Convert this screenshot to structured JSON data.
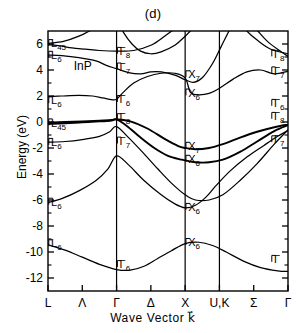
{
  "chart_data": {
    "type": "line",
    "title": "(d)",
    "material": "InP",
    "xlabel": "Wave  Vector  k⃗",
    "ylabel": "Energy  (eV)",
    "ylim": [
      -13,
      7
    ],
    "yticks": [
      6,
      4,
      2,
      0,
      -2,
      -4,
      -6,
      -8,
      -10,
      -12
    ],
    "ytick_labels": [
      "6",
      "4",
      "2",
      "0",
      "-2",
      "-4",
      "-6",
      "-8",
      "-10",
      "-12"
    ],
    "xticks": [
      0,
      1,
      2,
      3,
      4,
      5,
      6,
      7
    ],
    "xtick_labels": [
      "L",
      "Λ",
      "Γ",
      "Δ",
      "X",
      "U,K",
      "Σ",
      "Γ"
    ],
    "vertical_dividers": [
      "Γ",
      "X",
      "U,K"
    ],
    "grid": false,
    "legend": false,
    "point_labels": [
      {
        "text": "L",
        "sub": "45",
        "energy": 6.0,
        "kpoint": "L"
      },
      {
        "text": "L",
        "sub": "6",
        "energy": 5.1,
        "kpoint": "L"
      },
      {
        "text": "L",
        "sub": "6",
        "energy": 1.6,
        "kpoint": "L"
      },
      {
        "text": "L",
        "sub": "45",
        "energy": -0.1,
        "kpoint": "L"
      },
      {
        "text": "L",
        "sub": "6",
        "energy": -1.6,
        "kpoint": "L"
      },
      {
        "text": "L",
        "sub": "6",
        "energy": -6.2,
        "kpoint": "L"
      },
      {
        "text": "L",
        "sub": "6",
        "energy": -9.4,
        "kpoint": "L"
      },
      {
        "text": "Γ",
        "sub": "8",
        "energy": 5.4,
        "kpoint": "Γ"
      },
      {
        "text": "Γ",
        "sub": "7",
        "energy": 4.2,
        "kpoint": "Γ"
      },
      {
        "text": "Γ",
        "sub": "6",
        "energy": 1.7,
        "kpoint": "Γ"
      },
      {
        "text": "Γ",
        "sub": "8",
        "energy": 0.3,
        "kpoint": "Γ"
      },
      {
        "text": "Γ",
        "sub": "7",
        "energy": -1.5,
        "kpoint": "Γ"
      },
      {
        "text": "Γ",
        "sub": "6",
        "energy": -11.0,
        "kpoint": "Γ"
      },
      {
        "text": "X",
        "sub": "7",
        "energy": 3.6,
        "kpoint": "X"
      },
      {
        "text": "X",
        "sub": "6",
        "energy": 2.2,
        "kpoint": "X"
      },
      {
        "text": "X",
        "sub": "7",
        "energy": -1.9,
        "kpoint": "X"
      },
      {
        "text": "X",
        "sub": "6",
        "energy": -2.9,
        "kpoint": "X"
      },
      {
        "text": "X",
        "sub": "6",
        "energy": -6.6,
        "kpoint": "X"
      },
      {
        "text": "X",
        "sub": "6",
        "energy": -9.3,
        "kpoint": "X"
      },
      {
        "text": "Γ",
        "sub": "8",
        "energy": 5.2,
        "kpoint": "Γ-right"
      },
      {
        "text": "Γ",
        "sub": "7",
        "energy": 3.9,
        "kpoint": "Γ-right"
      },
      {
        "text": "Γ",
        "sub": "6",
        "energy": 1.4,
        "kpoint": "Γ-right"
      },
      {
        "text": "Γ",
        "sub": "8",
        "energy": 0.4,
        "kpoint": "Γ-right"
      },
      {
        "text": "Γ",
        "sub": "7",
        "energy": -1.4,
        "kpoint": "Γ-right"
      },
      {
        "text": "Γ",
        "sub": "",
        "energy": -10.6,
        "kpoint": "Γ-right"
      }
    ],
    "series": [
      {
        "name": "cb-5",
        "points": [
          [
            0,
            6.05
          ],
          [
            0.45,
            6.2
          ],
          [
            0.9,
            6.6
          ],
          [
            1.35,
            7.2
          ],
          [
            2,
            8.2
          ]
        ]
      },
      {
        "name": "cb-4",
        "points": [
          [
            0,
            5.95
          ],
          [
            0.35,
            5.85
          ],
          [
            0.7,
            5.7
          ],
          [
            1.1,
            5.6
          ],
          [
            1.5,
            5.5
          ],
          [
            2,
            5.45
          ],
          [
            2.5,
            5.5
          ],
          [
            3,
            5.9
          ],
          [
            3.4,
            6.6
          ],
          [
            3.8,
            7.4
          ],
          [
            4,
            8.0
          ]
        ]
      },
      {
        "name": "cb-3",
        "points": [
          [
            2,
            7.9
          ],
          [
            2.2,
            6.9
          ],
          [
            2.45,
            6.0
          ],
          [
            2.7,
            5.45
          ],
          [
            3,
            5.25
          ],
          [
            3.3,
            5.4
          ],
          [
            3.7,
            5.9
          ],
          [
            4,
            6.6
          ],
          [
            4.3,
            7.4
          ],
          [
            4.5,
            8.0
          ]
        ]
      },
      {
        "name": "cb-2",
        "points": [
          [
            0,
            5.15
          ],
          [
            0.4,
            5.1
          ],
          [
            0.9,
            4.95
          ],
          [
            1.4,
            4.7
          ],
          [
            1.7,
            4.35
          ],
          [
            2,
            4.1
          ],
          [
            2.35,
            3.8
          ],
          [
            2.7,
            3.7
          ],
          [
            3,
            3.85
          ],
          [
            3.3,
            3.85
          ],
          [
            3.7,
            3.6
          ],
          [
            4,
            3.25
          ],
          [
            4.25,
            3.05
          ],
          [
            4.5,
            3.4
          ],
          [
            4.8,
            4.5
          ],
          [
            5.05,
            5.8
          ],
          [
            5.3,
            7.1
          ],
          [
            5.5,
            8.0
          ]
        ]
      },
      {
        "name": "cb-1",
        "points": [
          [
            0,
            1.95
          ],
          [
            0.4,
            2.0
          ],
          [
            0.9,
            2.05
          ],
          [
            1.3,
            2.0
          ],
          [
            1.6,
            1.85
          ],
          [
            1.85,
            1.72
          ],
          [
            2,
            1.75
          ],
          [
            2.2,
            2.3
          ],
          [
            2.5,
            3.0
          ],
          [
            2.9,
            3.5
          ],
          [
            3.3,
            3.75
          ],
          [
            3.7,
            3.75
          ],
          [
            4,
            3.4
          ],
          [
            4.15,
            2.3
          ],
          [
            4.35,
            2.1
          ],
          [
            4.7,
            2.2
          ],
          [
            5,
            2.6
          ],
          [
            5.4,
            3.3
          ],
          [
            5.8,
            3.85
          ],
          [
            6.2,
            4.0
          ],
          [
            6.6,
            3.7
          ],
          [
            7,
            3.9
          ]
        ]
      },
      {
        "name": "cb-upper-right-a",
        "points": [
          [
            5.5,
            8.0
          ],
          [
            5.8,
            7.0
          ],
          [
            6.1,
            6.3
          ],
          [
            6.5,
            5.6
          ],
          [
            7,
            5.25
          ]
        ]
      },
      {
        "name": "cb-upper-right-b",
        "points": [
          [
            5.75,
            8.0
          ],
          [
            6.05,
            7.2
          ],
          [
            6.4,
            6.2
          ],
          [
            6.8,
            5.4
          ],
          [
            7,
            5.05
          ]
        ]
      },
      {
        "name": "vb-hh",
        "points": [
          [
            0,
            -0.05
          ],
          [
            0.5,
            0.0
          ],
          [
            1.0,
            0.05
          ],
          [
            1.5,
            0.1
          ],
          [
            1.85,
            0.15
          ],
          [
            2,
            0.2
          ],
          [
            2.4,
            0.05
          ],
          [
            2.9,
            -0.5
          ],
          [
            3.4,
            -1.3
          ],
          [
            3.8,
            -1.85
          ],
          [
            4,
            -2.0
          ],
          [
            4.3,
            -2.1
          ],
          [
            4.7,
            -2.0
          ],
          [
            5.1,
            -1.7
          ],
          [
            5.6,
            -1.2
          ],
          [
            6.1,
            -0.75
          ],
          [
            6.6,
            -0.4
          ],
          [
            7,
            -0.2
          ]
        ]
      },
      {
        "name": "vb-lh",
        "points": [
          [
            0,
            -0.15
          ],
          [
            0.5,
            -0.1
          ],
          [
            1.0,
            -0.02
          ],
          [
            1.5,
            0.05
          ],
          [
            1.85,
            0.12
          ],
          [
            2,
            0.2
          ],
          [
            2.3,
            -0.3
          ],
          [
            2.7,
            -1.2
          ],
          [
            3.1,
            -2.0
          ],
          [
            3.5,
            -2.6
          ],
          [
            3.9,
            -2.9
          ],
          [
            4,
            -2.95
          ],
          [
            4.3,
            -3.1
          ],
          [
            4.7,
            -3.1
          ],
          [
            5.1,
            -2.9
          ],
          [
            5.6,
            -2.3
          ],
          [
            6.1,
            -1.5
          ],
          [
            6.6,
            -0.7
          ],
          [
            7,
            -0.25
          ]
        ]
      },
      {
        "name": "vb-so",
        "points": [
          [
            0,
            -1.55
          ],
          [
            0.5,
            -1.5
          ],
          [
            1.0,
            -1.35
          ],
          [
            1.5,
            -1.1
          ],
          [
            1.8,
            -0.75
          ],
          [
            2,
            -0.35
          ],
          [
            2.35,
            -1.2
          ],
          [
            2.75,
            -2.3
          ],
          [
            3.2,
            -3.6
          ],
          [
            3.6,
            -4.7
          ],
          [
            4,
            -5.6
          ],
          [
            4.3,
            -6.0
          ],
          [
            4.7,
            -6.0
          ],
          [
            5.1,
            -5.6
          ],
          [
            5.6,
            -4.5
          ],
          [
            6.1,
            -3.2
          ],
          [
            6.6,
            -1.7
          ],
          [
            7,
            -0.6
          ]
        ]
      },
      {
        "name": "vb-x6-band",
        "points": [
          [
            0,
            -6.2
          ],
          [
            0.4,
            -5.9
          ],
          [
            0.9,
            -5.3
          ],
          [
            1.4,
            -4.5
          ],
          [
            1.75,
            -3.6
          ],
          [
            2,
            -2.6
          ],
          [
            2.35,
            -3.3
          ],
          [
            2.8,
            -4.5
          ],
          [
            3.3,
            -5.6
          ],
          [
            3.7,
            -6.3
          ],
          [
            4,
            -6.6
          ],
          [
            4.3,
            -6.4
          ],
          [
            4.6,
            -5.8
          ],
          [
            4.9,
            -4.9
          ],
          [
            5.3,
            -3.8
          ],
          [
            5.8,
            -2.7
          ],
          [
            6.3,
            -1.8
          ],
          [
            6.7,
            -1.1
          ],
          [
            7,
            -0.65
          ]
        ]
      },
      {
        "name": "vb-lowest",
        "points": [
          [
            0,
            -9.45
          ],
          [
            0.5,
            -9.85
          ],
          [
            1.0,
            -10.4
          ],
          [
            1.5,
            -10.95
          ],
          [
            2,
            -11.35
          ],
          [
            2.4,
            -11.4
          ],
          [
            2.8,
            -11.1
          ],
          [
            3.2,
            -10.5
          ],
          [
            3.6,
            -9.9
          ],
          [
            4,
            -9.35
          ],
          [
            4.4,
            -9.25
          ],
          [
            4.8,
            -9.5
          ],
          [
            5.2,
            -10.0
          ],
          [
            5.7,
            -10.7
          ],
          [
            6.2,
            -11.2
          ],
          [
            6.7,
            -11.45
          ],
          [
            7,
            -11.5
          ]
        ]
      }
    ]
  }
}
